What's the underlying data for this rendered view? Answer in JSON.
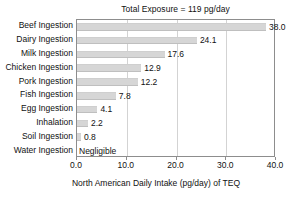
{
  "chart_data": {
    "type": "bar",
    "orientation": "horizontal",
    "title": "Total Exposure = 119 pg/day",
    "xlabel": "North American Daily Intake  (pg/day) of TEQ",
    "ylabel": "",
    "xlim": [
      0.0,
      40.0
    ],
    "xticks": [
      "0.0",
      "10.0",
      "20.0",
      "30.0",
      "40.0"
    ],
    "xtick_values": [
      0,
      10,
      20,
      30,
      40
    ],
    "grid": "vertical",
    "legend": "none",
    "categories": [
      "Beef Ingestion",
      "Dairy Ingestion",
      "Milk Ingestion",
      "Chicken Ingestion",
      "Pork Ingestion",
      "Fish Ingestion",
      "Egg Ingestion",
      "Inhalation",
      "Soil Ingestion",
      "Water Ingestion"
    ],
    "values": [
      38.0,
      24.1,
      17.6,
      12.9,
      12.2,
      7.8,
      4.1,
      2.2,
      0.8,
      0
    ],
    "value_labels": [
      "38.0",
      "24.1",
      "17.6",
      "12.9",
      "12.2",
      "7.8",
      "4.1",
      "2.2",
      "0.8",
      "Negligible"
    ],
    "bar_color": "#d6d6d6",
    "frame_color": "#8d8d8d",
    "grid_color": "#d3d3d3",
    "background": "#ffffff"
  }
}
